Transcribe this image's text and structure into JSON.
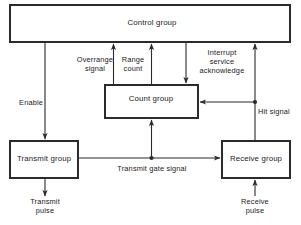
{
  "diagram": {
    "stroke_color": "#2b2b2b",
    "text_color": "#1a1a1a",
    "background": "#ffffff",
    "boxes": [
      {
        "id": "control-group",
        "label": "Control group",
        "x": 10,
        "y": 5,
        "w": 280,
        "h": 37
      },
      {
        "id": "count-group",
        "label": "Count group",
        "x": 105,
        "y": 85,
        "w": 93,
        "h": 33
      },
      {
        "id": "transmit-group",
        "label": "Transmit group",
        "x": 10,
        "y": 141,
        "w": 68,
        "h": 37
      },
      {
        "id": "receive-group",
        "label": "Receive group",
        "x": 222,
        "y": 141,
        "w": 68,
        "h": 37
      }
    ],
    "signal_labels": [
      {
        "id": "overrange-signal",
        "text": "Overrange\nsignal",
        "x": 95,
        "y": 64
      },
      {
        "id": "range-count",
        "text": "Range\ncount",
        "x": 133,
        "y": 64
      },
      {
        "id": "interrupt-service-acknowledge",
        "text": "Interrupt\nservice\nacknowledge",
        "x": 222,
        "y": 62
      },
      {
        "id": "enable",
        "text": "Enable",
        "x": 43,
        "y": 103
      },
      {
        "id": "hit-signal",
        "text": "Hit signal",
        "x": 258,
        "y": 112
      },
      {
        "id": "transmit-gate-signal",
        "text": "Transmit gate signal",
        "x": 152,
        "y": 168
      },
      {
        "id": "transmit-pulse",
        "text": "Transmit\npulse",
        "x": 45,
        "y": 206
      },
      {
        "id": "receive-pulse",
        "text": "Receive\npulse",
        "x": 255,
        "y": 206
      }
    ],
    "connections": [
      {
        "id": "control-to-transmit-enable",
        "from": "control-group",
        "to": "transmit-group",
        "label": "Enable",
        "direction": "down"
      },
      {
        "id": "count-to-control-overrange",
        "from": "count-group",
        "to": "control-group",
        "label": "Overrange signal",
        "direction": "up"
      },
      {
        "id": "count-to-control-range",
        "from": "count-group",
        "to": "control-group",
        "label": "Range count",
        "direction": "up"
      },
      {
        "id": "control-to-count-interrupt",
        "from": "control-group",
        "to": "count-group",
        "label": "Interrupt service acknowledge",
        "direction": "down"
      },
      {
        "id": "receive-to-control-hit",
        "from": "receive-group",
        "to": "control-group",
        "label": "Hit signal",
        "direction": "up"
      },
      {
        "id": "hit-to-count",
        "from": "receive-group",
        "to": "count-group",
        "label": "Hit signal",
        "direction": "left"
      },
      {
        "id": "transmit-to-receive-gate",
        "from": "transmit-group",
        "to": "receive-group",
        "label": "Transmit gate signal",
        "direction": "right"
      },
      {
        "id": "gate-to-count",
        "from": "transmit-group",
        "to": "count-group",
        "label": "Transmit gate signal",
        "direction": "up"
      },
      {
        "id": "transmit-output-pulse",
        "from": "transmit-group",
        "to": "transmit-pulse",
        "label": "Transmit pulse",
        "direction": "down"
      },
      {
        "id": "receive-input-pulse",
        "from": "receive-pulse",
        "to": "receive-group",
        "label": "Receive pulse",
        "direction": "up"
      }
    ]
  }
}
